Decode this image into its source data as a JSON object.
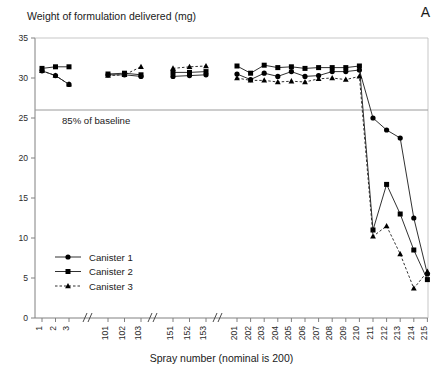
{
  "panel_label": "A",
  "chart_data": {
    "type": "line",
    "title": "Weight of formulation delivered  (mg)",
    "xlabel": "Spray number (nominal is 200)",
    "ylabel": "Weight of formulation delivered  (mg)",
    "ylim": [
      0,
      35
    ],
    "yticks": [
      0,
      5,
      10,
      15,
      20,
      25,
      30,
      35
    ],
    "ytick_labels": [
      "0",
      "5",
      "10",
      "15",
      "20",
      "25",
      "30",
      "35"
    ],
    "grid": false,
    "legend_position": "lower-left",
    "axis_breaks": true,
    "categories": [
      "1",
      "2",
      "3",
      "101",
      "102",
      "103",
      "151",
      "152",
      "153",
      "201",
      "202",
      "203",
      "204",
      "205",
      "206",
      "207",
      "208",
      "209",
      "210",
      "211",
      "212",
      "213",
      "214",
      "215"
    ],
    "series": [
      {
        "name": "Canister 1",
        "marker": "circle",
        "linestyle": "solid",
        "values": [
          30.9,
          30.3,
          29.2,
          30.4,
          30.4,
          30.2,
          30.2,
          30.3,
          30.4,
          30.5,
          29.8,
          30.6,
          30.2,
          30.8,
          30.2,
          30.3,
          30.8,
          30.8,
          31.0,
          25.0,
          23.5,
          22.5,
          12.5,
          5.5
        ]
      },
      {
        "name": "Canister 2",
        "marker": "square",
        "linestyle": "solid",
        "values": [
          31.2,
          31.4,
          31.4,
          30.5,
          30.6,
          30.4,
          30.7,
          30.7,
          30.8,
          31.5,
          30.6,
          31.6,
          31.3,
          31.4,
          31.2,
          31.3,
          31.3,
          31.3,
          31.5,
          11.0,
          16.7,
          13.0,
          8.5,
          4.8
        ]
      },
      {
        "name": "Canister 3",
        "marker": "triangle",
        "linestyle": "dashed",
        "values": [
          30.9,
          30.3,
          29.2,
          30.3,
          30.4,
          31.4,
          31.2,
          31.4,
          31.5,
          30.0,
          29.7,
          29.7,
          29.5,
          29.6,
          29.5,
          29.9,
          30.0,
          29.8,
          30.2,
          10.2,
          11.5,
          8.0,
          3.7,
          5.8
        ]
      }
    ],
    "annotations": [
      {
        "text": "85% of baseline",
        "type": "hline",
        "y": 26.0
      }
    ]
  },
  "legend": {
    "items": [
      {
        "label": "Canister 1"
      },
      {
        "label": "Canister 2"
      },
      {
        "label": "Canister 3"
      }
    ]
  },
  "colors": {
    "line": "#1a1a1a",
    "marker": "#000000",
    "axis": "#808080",
    "baseline": "#9a9a9a",
    "text": "#1a1a1a"
  }
}
